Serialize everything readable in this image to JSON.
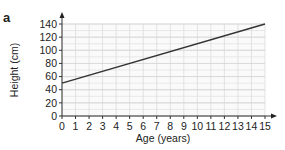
{
  "panel_label": "a",
  "chart_data": {
    "type": "line",
    "title": "",
    "xlabel": "Age (years)",
    "ylabel": "Height (cm)",
    "x_ticks": [
      0,
      1,
      2,
      3,
      4,
      5,
      6,
      7,
      8,
      9,
      10,
      11,
      12,
      13,
      14,
      15
    ],
    "y_ticks": [
      0,
      20,
      40,
      60,
      80,
      100,
      120,
      140
    ],
    "xlim": [
      0,
      15
    ],
    "ylim": [
      0,
      140
    ],
    "grid": true,
    "legend": null,
    "series": [
      {
        "name": "Height",
        "x": [
          0,
          15
        ],
        "y": [
          50,
          140
        ],
        "color": "#333333"
      }
    ]
  }
}
